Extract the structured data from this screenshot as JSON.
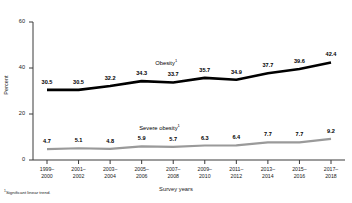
{
  "chart_data": {
    "type": "line",
    "title": "",
    "xlabel": "Survey years",
    "ylabel": "Percent",
    "ylim": [
      0,
      60
    ],
    "yticks": [
      0,
      20,
      40,
      60
    ],
    "grid": false,
    "legend_position": "inline-series-labels",
    "categories": [
      "1999–2000",
      "2001–2002",
      "2003–2004",
      "2005–2006",
      "2007–2008",
      "2009–2010",
      "2011–2012",
      "2013–2014",
      "2015–2016",
      "2017–2018"
    ],
    "categories_lines": [
      [
        "1999–",
        "2000"
      ],
      [
        "2001–",
        "2002"
      ],
      [
        "2003–",
        "2004"
      ],
      [
        "2005–",
        "2006"
      ],
      [
        "2007–",
        "2008"
      ],
      [
        "2009–",
        "2010"
      ],
      [
        "2011–",
        "2012"
      ],
      [
        "2013–",
        "2014"
      ],
      [
        "2015–",
        "2016"
      ],
      [
        "2017–",
        "2018"
      ]
    ],
    "series": [
      {
        "name": "Obesity",
        "name_superscript": "1",
        "color": "#000000",
        "values": [
          30.5,
          30.5,
          32.2,
          34.3,
          33.7,
          35.7,
          34.9,
          37.7,
          39.6,
          42.4
        ],
        "labels": [
          "30.5",
          "30.5",
          "32.2",
          "34.3",
          "33.7",
          "35.7",
          "34.9",
          "37.7",
          "39.6",
          "42.4"
        ]
      },
      {
        "name": "Severe obesity",
        "name_superscript": "1",
        "color": "#9a9a9a",
        "values": [
          4.7,
          5.1,
          4.8,
          5.9,
          5.7,
          6.3,
          6.4,
          7.7,
          7.7,
          9.2
        ],
        "labels": [
          "4.7",
          "5.1",
          "4.8",
          "5.9",
          "5.7",
          "6.3",
          "6.4",
          "7.7",
          "7.7",
          "9.2"
        ]
      }
    ],
    "annotations": [
      {
        "text": "Obesity",
        "superscript": "1",
        "series": "Obesity"
      },
      {
        "text": "Severe obesity",
        "superscript": "1",
        "series": "Severe obesity"
      }
    ],
    "footnote": "Significant linear trend.",
    "footnote_marker": "1"
  },
  "axis": {
    "y_tick_labels": [
      "60",
      "40",
      "20",
      "0"
    ],
    "y_title": "Percent",
    "x_title": "Survey years"
  }
}
